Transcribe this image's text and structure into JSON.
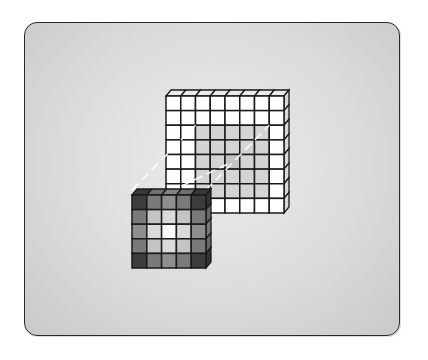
{
  "diagram": {
    "type": "convolution-illustration",
    "panel": {
      "background_center": "#ececec",
      "background_edge": "#c9c9c9",
      "border": "#2a2a2a"
    },
    "input_grid": {
      "rows": 8,
      "cols": 8,
      "cell_fill": "#ffffff",
      "highlight_fill": "#d4d4d4",
      "highlight_center_fill": "#c4c4c4",
      "highlight_region": {
        "row_start": 2,
        "row_end": 6,
        "col_start": 2,
        "col_end": 6
      }
    },
    "kernel": {
      "rows": 5,
      "cols": 5,
      "shades": [
        [
          "#3c3c3c",
          "#7a7a7a",
          "#8e8e8e",
          "#7a7a7a",
          "#3c3c3c"
        ],
        [
          "#7a7a7a",
          "#c4c4c4",
          "#dadada",
          "#c4c4c4",
          "#7a7a7a"
        ],
        [
          "#8e8e8e",
          "#dadada",
          "#fafafa",
          "#dadada",
          "#8e8e8e"
        ],
        [
          "#7a7a7a",
          "#c4c4c4",
          "#dadada",
          "#c4c4c4",
          "#7a7a7a"
        ],
        [
          "#3c3c3c",
          "#7a7a7a",
          "#8e8e8e",
          "#7a7a7a",
          "#3c3c3c"
        ]
      ]
    },
    "connector_color": "#ffffff"
  }
}
